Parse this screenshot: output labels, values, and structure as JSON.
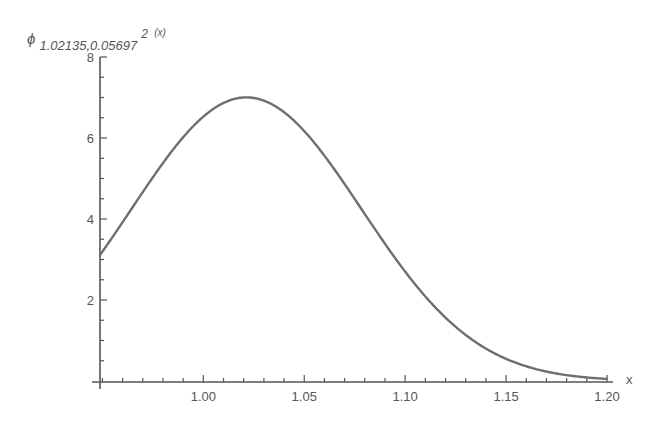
{
  "chart_data": {
    "type": "line",
    "title": "",
    "ylabel": {
      "symbol": "ϕ",
      "subscript": "1.02135,0.05697",
      "superscript": "2",
      "arg": "(x)",
      "full": "ϕ_{1.02135,0.05697^2}(x)"
    },
    "xlabel": "x",
    "xlim": [
      0.9488,
      1.2
    ],
    "ylim": [
      0,
      8
    ],
    "x_ticks": [
      1.0,
      1.05,
      1.1,
      1.15,
      1.2
    ],
    "x_tick_labels": [
      "1.00",
      "1.05",
      "1.10",
      "1.15",
      "1.20"
    ],
    "x_minor_step": 0.01,
    "y_ticks": [
      2,
      4,
      6,
      8
    ],
    "y_tick_labels": [
      "2",
      "4",
      "6",
      "8"
    ],
    "y_minor_step": 0.5,
    "grid": false,
    "legend": null,
    "series": [
      {
        "name": "normal pdf mu=1.02135 sigma=0.05697",
        "mu": 1.02135,
        "sigma": 0.05697,
        "color": "#6e6e6e",
        "x": [
          0.95,
          0.96,
          0.97,
          0.98,
          0.99,
          1.0,
          1.01,
          1.02,
          1.03,
          1.04,
          1.05,
          1.06,
          1.07,
          1.08,
          1.09,
          1.1,
          1.11,
          1.12,
          1.13,
          1.14,
          1.15,
          1.16,
          1.17,
          1.18,
          1.19,
          1.2
        ],
        "values": [
          3.2,
          3.93,
          4.66,
          5.35,
          5.95,
          6.45,
          6.83,
          7.0,
          6.98,
          6.82,
          6.47,
          5.99,
          5.38,
          4.69,
          3.97,
          3.25,
          2.58,
          1.98,
          1.46,
          1.05,
          0.72,
          0.48,
          0.31,
          0.19,
          0.11,
          0.06
        ]
      }
    ]
  },
  "plot": {
    "axis_color": "#555555",
    "curve_color": "#6e6e6e",
    "background": "#ffffff"
  }
}
